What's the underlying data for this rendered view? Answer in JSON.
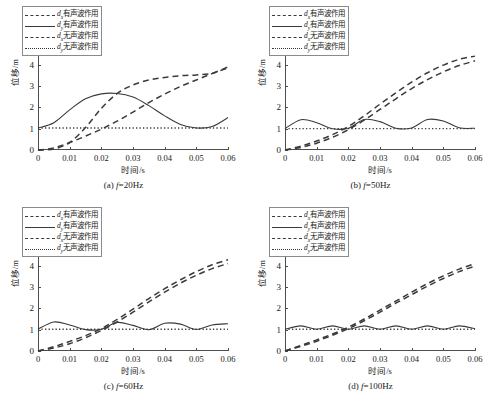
{
  "figure": {
    "axis_exponent": "×10",
    "axis_exponent_sup": "-3",
    "ylabel": "位移/m",
    "xlabel": "时间/s",
    "yticks": [
      "0",
      "1",
      "2",
      "3",
      "4",
      "5",
      "6"
    ],
    "xticks": [
      "0",
      "0.01",
      "0.02",
      "0.03",
      "0.04",
      "0.05",
      "0.06"
    ],
    "line_color": "#3a3a3a",
    "axis_color": "#4d4d4d",
    "background": "#ffffff"
  },
  "legend": {
    "entries": [
      {
        "symbol": "d",
        "sub": "x",
        "text": "有声波作用",
        "style": "dashed",
        "name": "dx-with-acoustic"
      },
      {
        "symbol": "d",
        "sub": "y",
        "text": "有声波作用",
        "style": "solid",
        "name": "dy-with-acoustic"
      },
      {
        "symbol": "d",
        "sub": "x",
        "text": "无声波作用",
        "style": "dashed",
        "name": "dx-without-acoustic"
      },
      {
        "symbol": "d",
        "sub": "y",
        "text": "无声波作用",
        "style": "dotted",
        "name": "dy-without-acoustic"
      }
    ]
  },
  "subplots": [
    {
      "key": "a",
      "caption_prefix": "(a) ",
      "caption_var": "f",
      "caption_value": "=20Hz",
      "frequency_hz": 20
    },
    {
      "key": "b",
      "caption_prefix": "(b) ",
      "caption_var": "f",
      "caption_value": "=50Hz",
      "frequency_hz": 50
    },
    {
      "key": "c",
      "caption_prefix": "(c) ",
      "caption_var": "f",
      "caption_value": "=60Hz",
      "frequency_hz": 60
    },
    {
      "key": "d",
      "caption_prefix": "(d) ",
      "caption_var": "f",
      "caption_value": "=100Hz",
      "frequency_hz": 100
    }
  ],
  "chart_data": [
    {
      "type": "line",
      "title": "(a) f=20Hz",
      "xlabel": "时间/s",
      "ylabel": "位移/m",
      "xlim": [
        0,
        0.06
      ],
      "ylim": [
        0,
        0.006
      ],
      "y_scale": "1e-3",
      "grid": false,
      "legend_position": "upper-left",
      "x": [
        0,
        0.005,
        0.01,
        0.015,
        0.02,
        0.025,
        0.03,
        0.035,
        0.04,
        0.045,
        0.05,
        0.055,
        0.06
      ],
      "series": [
        {
          "name": "dx有声波作用",
          "style": "dashed",
          "values": [
            0.0,
            5e-05,
            0.00035,
            0.00105,
            0.00195,
            0.00265,
            0.00305,
            0.00328,
            0.0034,
            0.00348,
            0.00352,
            0.0036,
            0.0039
          ]
        },
        {
          "name": "dy有声波作用",
          "style": "solid",
          "values": [
            0.00103,
            0.00128,
            0.00188,
            0.0024,
            0.00263,
            0.00265,
            0.00248,
            0.00208,
            0.0016,
            0.0012,
            0.00103,
            0.0011,
            0.00152
          ]
        },
        {
          "name": "dx无声波作用",
          "style": "dashed",
          "values": [
            0.0,
            0.0001,
            0.00035,
            0.00065,
            0.00098,
            0.00135,
            0.00178,
            0.00222,
            0.00262,
            0.00298,
            0.00328,
            0.00358,
            0.00385
          ]
        },
        {
          "name": "dy无声波作用",
          "style": "dotted",
          "values": [
            0.00103,
            0.00103,
            0.00103,
            0.00103,
            0.00103,
            0.00103,
            0.00103,
            0.00103,
            0.00103,
            0.00103,
            0.00103,
            0.00103,
            0.00103
          ]
        }
      ]
    },
    {
      "type": "line",
      "title": "(b) f=50Hz",
      "xlabel": "时间/s",
      "ylabel": "位移/m",
      "xlim": [
        0,
        0.06
      ],
      "ylim": [
        0,
        0.006
      ],
      "y_scale": "1e-3",
      "grid": false,
      "legend_position": "upper-left",
      "x": [
        0,
        0.005,
        0.01,
        0.015,
        0.02,
        0.025,
        0.03,
        0.035,
        0.04,
        0.045,
        0.05,
        0.055,
        0.06
      ],
      "series": [
        {
          "name": "dx有声波作用",
          "style": "dashed",
          "values": [
            0.0,
            0.00018,
            0.00042,
            0.00072,
            0.0011,
            0.0016,
            0.00215,
            0.00268,
            0.00318,
            0.00362,
            0.00398,
            0.00425,
            0.0044
          ]
        },
        {
          "name": "dy有声波作用",
          "style": "solid",
          "values": [
            0.001,
            0.00142,
            0.00128,
            0.001,
            0.00102,
            0.00143,
            0.00133,
            0.00102,
            0.00103,
            0.00143,
            0.00136,
            0.00104,
            0.00102
          ]
        },
        {
          "name": "dx无声波作用",
          "style": "dashed",
          "values": [
            0.0,
            0.00012,
            0.00032,
            0.0006,
            0.00095,
            0.0014,
            0.0019,
            0.0024,
            0.00288,
            0.0033,
            0.00366,
            0.00396,
            0.00418
          ]
        },
        {
          "name": "dy无声波作用",
          "style": "dotted",
          "values": [
            0.001,
            0.001,
            0.001,
            0.001,
            0.001,
            0.001,
            0.001,
            0.001,
            0.001,
            0.001,
            0.001,
            0.001,
            0.001
          ]
        }
      ]
    },
    {
      "type": "line",
      "title": "(c) f=60Hz",
      "xlabel": "时间/s",
      "ylabel": "位移/m",
      "xlim": [
        0,
        0.06
      ],
      "ylim": [
        0,
        0.006
      ],
      "y_scale": "1e-3",
      "grid": false,
      "legend_position": "upper-left",
      "x": [
        0,
        0.005,
        0.01,
        0.015,
        0.02,
        0.025,
        0.03,
        0.035,
        0.04,
        0.045,
        0.05,
        0.055,
        0.06
      ],
      "series": [
        {
          "name": "dx有声波作用",
          "style": "dashed",
          "values": [
            0.0,
            0.0002,
            0.00045,
            0.00072,
            0.00105,
            0.00148,
            0.00196,
            0.00246,
            0.00292,
            0.00334,
            0.00372,
            0.00404,
            0.00428
          ]
        },
        {
          "name": "dy有声波作用",
          "style": "solid",
          "values": [
            0.00102,
            0.00136,
            0.00122,
            0.001,
            0.00102,
            0.00134,
            0.0012,
            0.001,
            0.0013,
            0.00126,
            0.00101,
            0.00122,
            0.00128
          ]
        },
        {
          "name": "dx无声波作用",
          "style": "dashed",
          "values": [
            0.0,
            0.00014,
            0.00034,
            0.00062,
            0.00096,
            0.00136,
            0.00182,
            0.0023,
            0.00276,
            0.00318,
            0.00355,
            0.00386,
            0.0041
          ]
        },
        {
          "name": "dy无声波作用",
          "style": "dotted",
          "values": [
            0.00102,
            0.00102,
            0.00102,
            0.00102,
            0.00102,
            0.00102,
            0.00102,
            0.00102,
            0.00102,
            0.00102,
            0.00102,
            0.00102,
            0.00102
          ]
        }
      ]
    },
    {
      "type": "line",
      "title": "(d) f=100Hz",
      "xlabel": "时间/s",
      "ylabel": "位移/m",
      "xlim": [
        0,
        0.06
      ],
      "ylim": [
        0,
        0.006
      ],
      "y_scale": "1e-3",
      "grid": false,
      "legend_position": "upper-left",
      "x": [
        0,
        0.005,
        0.01,
        0.015,
        0.02,
        0.025,
        0.03,
        0.035,
        0.04,
        0.045,
        0.05,
        0.055,
        0.06
      ],
      "series": [
        {
          "name": "dx有声波作用",
          "style": "dashed",
          "values": [
            0.0,
            0.00026,
            0.00052,
            0.0008,
            0.00112,
            0.0015,
            0.00192,
            0.00234,
            0.00276,
            0.00316,
            0.00352,
            0.00384,
            0.0041
          ]
        },
        {
          "name": "dy有声波作用",
          "style": "solid",
          "values": [
            0.00102,
            0.00118,
            0.00102,
            0.00118,
            0.00102,
            0.00118,
            0.00102,
            0.00118,
            0.00102,
            0.00118,
            0.00102,
            0.00118,
            0.00104
          ]
        },
        {
          "name": "dx无声波作用",
          "style": "dashed",
          "values": [
            0.0,
            0.00022,
            0.00046,
            0.00074,
            0.00105,
            0.00142,
            0.00182,
            0.00224,
            0.00264,
            0.00304,
            0.0034,
            0.00372,
            0.00398
          ]
        },
        {
          "name": "dy无声波作用",
          "style": "dotted",
          "values": [
            0.00102,
            0.00102,
            0.00102,
            0.00102,
            0.00102,
            0.00102,
            0.00102,
            0.00102,
            0.00102,
            0.00102,
            0.00102,
            0.00102,
            0.00102
          ]
        }
      ]
    }
  ]
}
